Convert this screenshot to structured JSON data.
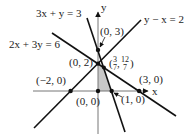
{
  "figure": {
    "axes": {
      "x_label": "x",
      "y_label": "y"
    },
    "lines": [
      {
        "id": "line1",
        "equation": "3x + y = 3"
      },
      {
        "id": "line2",
        "equation": "2x + 3y = 6"
      },
      {
        "id": "line3",
        "equation": "y − x = 2"
      }
    ],
    "points": [
      {
        "id": "p_neg2_0",
        "label": "(−2, 0)"
      },
      {
        "id": "p_0_0",
        "label": "(0, 0)"
      },
      {
        "id": "p_1_0",
        "label": "(1, 0)"
      },
      {
        "id": "p_3_0",
        "label": "(3, 0)"
      },
      {
        "id": "p_0_2",
        "label": "(0, 2)"
      },
      {
        "id": "p_0_3",
        "label": "(0, 3)"
      },
      {
        "id": "p_int",
        "label_x": "3",
        "label_x_den": "7",
        "label_y": "12",
        "label_y_den": "7"
      }
    ],
    "shaded_region": {
      "vertices": [
        "(0, 0)",
        "(1, 0)",
        "(3/7, 12/7)",
        "(0, 2)"
      ],
      "color": "#c8c8c8"
    }
  }
}
